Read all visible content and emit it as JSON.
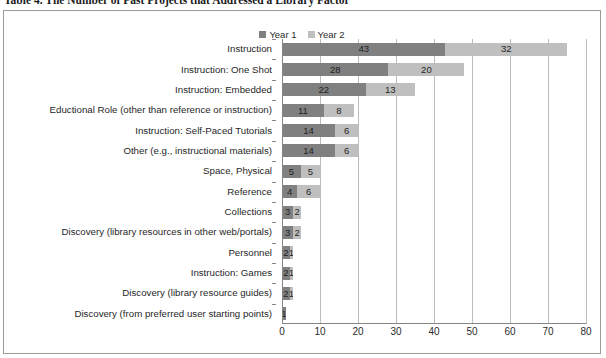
{
  "caption": "Table 4. The Number of Past Projects that Addressed a Library Factor",
  "legend": {
    "position": "top-center",
    "entries": [
      {
        "label": "Year 1",
        "color": "#808080"
      },
      {
        "label": "Year 2",
        "color": "#bfbfbf"
      }
    ]
  },
  "chart_data": {
    "type": "bar",
    "orientation": "horizontal",
    "stacked": true,
    "title": "Table 4. The Number of Past Projects that Addressed a Library Factor",
    "xlabel": "",
    "ylabel": "",
    "xlim": [
      0,
      80
    ],
    "xticks": [
      0,
      10,
      20,
      30,
      40,
      50,
      60,
      70,
      80
    ],
    "grid": "vertical",
    "legend_position": "top-center",
    "categories": [
      "Instruction",
      "Instruction: One Shot",
      "Instruction: Embedded",
      "Eductional Role (other than reference or instruction)",
      "Instruction: Self-Paced Tutorials",
      "Other (e.g., instructional materials)",
      "Space, Physical",
      "Reference",
      "Collections",
      "Discovery (library resources in other web/portals)",
      "Personnel",
      "Instruction: Games",
      "Discovery (library resource guides)",
      "Discovery (from preferred user starting points)"
    ],
    "series": [
      {
        "name": "Year 1",
        "color": "#808080",
        "values": [
          43,
          28,
          22,
          11,
          14,
          14,
          5,
          4,
          3,
          3,
          2,
          2,
          2,
          1
        ]
      },
      {
        "name": "Year 2",
        "color": "#bfbfbf",
        "values": [
          32,
          20,
          13,
          8,
          6,
          6,
          5,
          6,
          2,
          2,
          1,
          1,
          1,
          0
        ]
      }
    ]
  }
}
